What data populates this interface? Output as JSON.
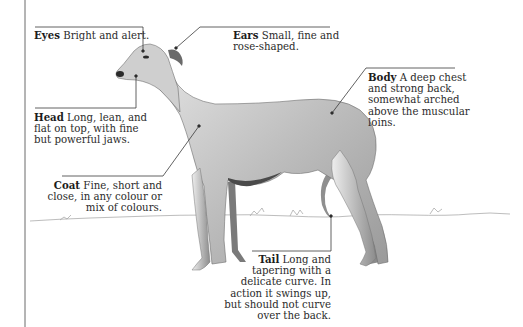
{
  "diagram": {
    "callouts": [
      {
        "id": "eyes",
        "term": "Eyes",
        "lines": [
          "Bright and alert."
        ]
      },
      {
        "id": "ears",
        "term": "Ears",
        "lines": [
          "Small, fine and",
          "rose-shaped."
        ]
      },
      {
        "id": "head",
        "term": "Head",
        "lines": [
          "Long, lean, and",
          "flat on top, with fine",
          "but powerful jaws."
        ]
      },
      {
        "id": "body",
        "term": "Body",
        "lines": [
          "A deep chest",
          "and strong back,",
          "somewhat arched",
          "above the muscular",
          "loins."
        ]
      },
      {
        "id": "coat",
        "term": "Coat",
        "lines": [
          "Fine, short and",
          "close, in any colour or",
          "mix of colours."
        ]
      },
      {
        "id": "tail",
        "term": "Tail",
        "lines": [
          "Long and",
          "tapering with a",
          "delicate curve. In",
          "action it swings up,",
          "but should not curve",
          "over the back."
        ]
      }
    ],
    "colors": {
      "background": "#ffffff",
      "leader_line": "#3a3a3a",
      "text": "#2b2b2b",
      "dog_light": "#d9d9d9",
      "dog_mid": "#b0b0b0",
      "dog_dark": "#5a5a5a"
    }
  }
}
